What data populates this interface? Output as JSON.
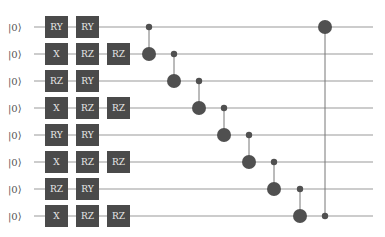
{
  "circuit": {
    "wire_color": "#9a9a9a",
    "gate_color": "#4a4a4a",
    "dot_color": "#505050",
    "qubits": [
      {
        "label": "|0⟩",
        "y": 27,
        "gates": [
          "RY",
          "RY"
        ]
      },
      {
        "label": "|0⟩",
        "y": 54,
        "gates": [
          "X",
          "RZ",
          "RZ"
        ]
      },
      {
        "label": "|0⟩",
        "y": 81,
        "gates": [
          "RZ",
          "RY"
        ]
      },
      {
        "label": "|0⟩",
        "y": 108,
        "gates": [
          "X",
          "RZ",
          "RZ"
        ]
      },
      {
        "label": "|0⟩",
        "y": 135,
        "gates": [
          "RY",
          "RY"
        ]
      },
      {
        "label": "|0⟩",
        "y": 162,
        "gates": [
          "X",
          "RZ",
          "RZ"
        ]
      },
      {
        "label": "|0⟩",
        "y": 189,
        "gates": [
          "RZ",
          "RY"
        ]
      },
      {
        "label": "|0⟩",
        "y": 216,
        "gates": [
          "X",
          "RZ",
          "RZ"
        ]
      }
    ],
    "gate_columns_x": [
      45,
      76,
      107
    ],
    "controlled_gates": [
      {
        "control": 0,
        "target": 1,
        "x": 149
      },
      {
        "control": 1,
        "target": 2,
        "x": 174
      },
      {
        "control": 2,
        "target": 3,
        "x": 199
      },
      {
        "control": 3,
        "target": 4,
        "x": 224
      },
      {
        "control": 4,
        "target": 5,
        "x": 249
      },
      {
        "control": 5,
        "target": 6,
        "x": 274
      },
      {
        "control": 6,
        "target": 7,
        "x": 300
      },
      {
        "control": 7,
        "target": 0,
        "x": 325
      }
    ]
  }
}
